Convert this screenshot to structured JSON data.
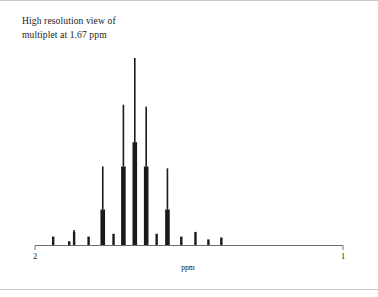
{
  "figure": {
    "caption_line1": "High resolution view of",
    "caption_line2": "multiplet at 1.67 ppm"
  },
  "axis": {
    "ppm_label": "ppm",
    "tick_left_label": "2",
    "tick_right_label": "1"
  },
  "chart_data": {
    "type": "bar",
    "title": "High resolution view of multiplet at 1.67 ppm",
    "xlabel": "ppm",
    "ylabel": "",
    "xlim": [
      2.0,
      1.0
    ],
    "x_axis_inverted": true,
    "grid": false,
    "legend": null,
    "note": "1H NMR multiplet (approx. septet with fine structure). x values in ppm, y values in relative intensity (0-100). Each line has a thin spike (peak height) and a thicker lower stub (integral/base).",
    "x_tick_values": [
      2.0,
      1.0
    ],
    "x_tick_labels": [
      "2",
      "1"
    ],
    "x": [
      1.941,
      1.889,
      1.873,
      1.826,
      1.78,
      1.745,
      1.713,
      1.676,
      1.639,
      1.605,
      1.57,
      1.525,
      1.479,
      1.437,
      1.395
    ],
    "values": [
      4.5,
      2.0,
      8.0,
      4.5,
      42.0,
      6.0,
      75.0,
      100.0,
      74.0,
      6.0,
      41.0,
      4.5,
      7.0,
      3.0,
      4.0
    ],
    "base_values": [
      4.5,
      2.0,
      7.0,
      4.5,
      19.0,
      6.0,
      42.0,
      55.0,
      42.0,
      6.0,
      19.0,
      4.5,
      7.0,
      3.0,
      4.0
    ],
    "categories": [
      "1.941",
      "1.889",
      "1.873",
      "1.826",
      "1.780",
      "1.745",
      "1.713",
      "1.676",
      "1.639",
      "1.605",
      "1.570",
      "1.525",
      "1.479",
      "1.437",
      "1.395"
    ]
  }
}
